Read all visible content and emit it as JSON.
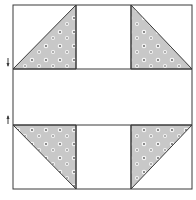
{
  "diagram": {
    "colors": {
      "background": "#ffffff",
      "outline": "#3a3a3a",
      "print_fill": "#c8c8c8",
      "flower_fill": "#f4f4f4",
      "flower_center": "#5a5a5a"
    },
    "block": {
      "x": 13,
      "y": 5,
      "w": 179,
      "h": 184
    },
    "middle_band": {
      "y1": 69,
      "y2": 125
    },
    "inner_columns": {
      "x1": 76,
      "x2": 131
    },
    "triangles": [
      {
        "name": "top-left",
        "points": "13,69 76,69 76,5"
      },
      {
        "name": "top-right",
        "points": "131,5 131,69 192,69"
      },
      {
        "name": "bottom-left",
        "points": "13,125 76,125 76,189"
      },
      {
        "name": "bottom-right",
        "points": "131,125 192,125 131,189"
      }
    ],
    "arrows": [
      {
        "name": "down-arrow",
        "direction": "down",
        "x": 8,
        "y": 64
      },
      {
        "name": "up-arrow",
        "direction": "up",
        "x": 8,
        "y": 121
      }
    ]
  }
}
